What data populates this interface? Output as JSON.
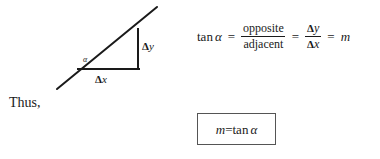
{
  "figure": {
    "background_color": "#ffffff",
    "ink_color": "#1a1a1a",
    "box_border_color": "#555555"
  },
  "diagram": {
    "name": "slope-right-triangle",
    "labels": {
      "delta_symbol": "Δ",
      "rise_var": "y",
      "run_var": "x",
      "angle": "α"
    },
    "geometry": {
      "angle_vertex": [
        78,
        69
      ],
      "right_angle_corner": [
        138,
        69
      ],
      "top_vertex": [
        138,
        30
      ],
      "diagonal_start": [
        57,
        89
      ],
      "diagonal_end": [
        157,
        7
      ]
    }
  },
  "thus": {
    "text": "Thus,"
  },
  "equation": {
    "lhs_operator": "tan",
    "lhs_angle": "α",
    "equals": "=",
    "fraction_1": {
      "numerator": "opposite",
      "denominator": "adjacent"
    },
    "fraction_2": {
      "numerator_delta": "Δ",
      "numerator_var": "y",
      "denominator_delta": "Δ",
      "denominator_var": "x"
    },
    "result": "m",
    "full_text": "tan α = opposite/adjacent = Δy/Δx = m"
  },
  "boxed_result": {
    "slope_symbol": "m",
    "equals": "=",
    "operator": "tan",
    "angle": "α",
    "full_text": "m = tan α"
  }
}
